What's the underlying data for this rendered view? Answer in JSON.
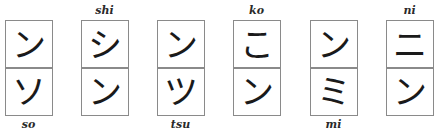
{
  "pairs": [
    {
      "top_char": "ン",
      "bottom_char": "ソ",
      "top_label": "",
      "bottom_label": "so"
    },
    {
      "top_char": "シ",
      "bottom_char": "ン",
      "top_label": "shi",
      "bottom_label": ""
    },
    {
      "top_char": "ン",
      "bottom_char": "ツ",
      "top_label": "",
      "bottom_label": "tsu"
    },
    {
      "top_char": "こ",
      "bottom_char": "ン",
      "top_label": "ko",
      "bottom_label": ""
    },
    {
      "top_char": "ン",
      "bottom_char": "ミ",
      "top_label": "",
      "bottom_label": "mi"
    },
    {
      "top_char": "ニ",
      "bottom_char": "ン",
      "top_label": "ni",
      "bottom_label": ""
    }
  ]
}
